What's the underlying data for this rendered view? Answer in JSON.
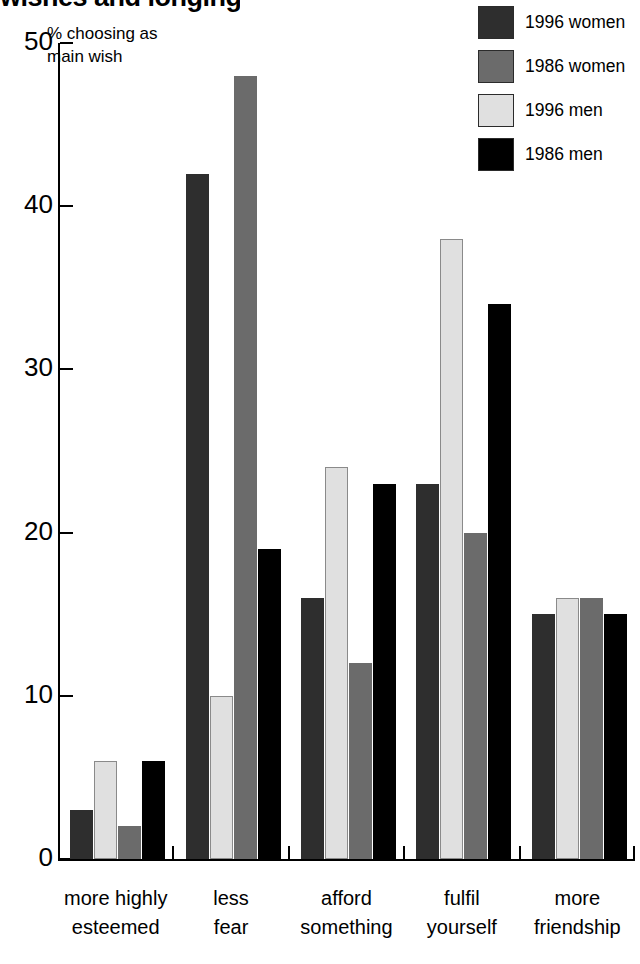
{
  "title": {
    "text": "wishes and longings",
    "note": "clipped at top edge of screenshot"
  },
  "axis_caption": "% choosing as\nmain wish",
  "legend": {
    "position": "top-right",
    "items": [
      {
        "label": "1996 women",
        "color": "#2e2e2e",
        "icon": "legend-swatch-icon"
      },
      {
        "label": "1986 women",
        "color": "#6b6b6b",
        "icon": "legend-swatch-icon"
      },
      {
        "label": "1996 men",
        "color": "#e0e0e0",
        "icon": "legend-swatch-icon"
      },
      {
        "label": "1986 men",
        "color": "#000000",
        "icon": "legend-swatch-icon"
      }
    ]
  },
  "yaxis": {
    "ticks": [
      "0",
      "10",
      "20",
      "30",
      "40",
      "50"
    ],
    "min": 0,
    "max": 50
  },
  "chart_data": {
    "type": "bar",
    "title": "wishes and longings",
    "xlabel": "",
    "ylabel": "% choosing as main wish",
    "ylim": [
      0,
      50
    ],
    "yticks": [
      0,
      10,
      20,
      30,
      40,
      50
    ],
    "grid": false,
    "legend_position": "top-right",
    "categories": [
      "more highly\nesteemed",
      "less\nfear",
      "afford\nsomething",
      "fulfil\nyourself",
      "more\nfriendship"
    ],
    "series": [
      {
        "name": "1996 women",
        "color": "#2e2e2e",
        "values": [
          3,
          42,
          16,
          23,
          15
        ]
      },
      {
        "name": "1986 women",
        "color": "#6b6b6b",
        "values": [
          2,
          48,
          12,
          20,
          16
        ]
      },
      {
        "name": "1996 men",
        "color": "#e0e0e0",
        "values": [
          6,
          10,
          24,
          38,
          16
        ]
      },
      {
        "name": "1986 men",
        "color": "#000000",
        "values": [
          6,
          19,
          23,
          34,
          15
        ]
      }
    ],
    "bar_draw_order": [
      "1996 women",
      "1996 men",
      "1986 women",
      "1986 men"
    ]
  }
}
